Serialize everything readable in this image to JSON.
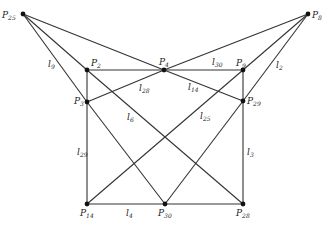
{
  "diagram": {
    "points": [
      {
        "id": "P25",
        "name": "P",
        "sub": "25",
        "x": 23,
        "y": 14,
        "lx": 2,
        "ly": 18
      },
      {
        "id": "P8",
        "name": "P",
        "sub": "8",
        "x": 308,
        "y": 14,
        "lx": 312,
        "ly": 18
      },
      {
        "id": "P2",
        "name": "P",
        "sub": "2",
        "x": 87,
        "y": 70,
        "lx": 91,
        "ly": 66
      },
      {
        "id": "P4",
        "name": "P",
        "sub": "4",
        "x": 164,
        "y": 70,
        "lx": 159,
        "ly": 65
      },
      {
        "id": "P9",
        "name": "P",
        "sub": "9",
        "x": 243,
        "y": 70,
        "lx": 236,
        "ly": 66
      },
      {
        "id": "P3",
        "name": "P",
        "sub": "3",
        "x": 87,
        "y": 102,
        "lx": 74,
        "ly": 104
      },
      {
        "id": "P29",
        "name": "P",
        "sub": "29",
        "x": 243,
        "y": 101,
        "lx": 247,
        "ly": 104
      },
      {
        "id": "P14",
        "name": "P",
        "sub": "14",
        "x": 87,
        "y": 204,
        "lx": 80,
        "ly": 216
      },
      {
        "id": "P30",
        "name": "P",
        "sub": "30",
        "x": 165,
        "y": 204,
        "lx": 158,
        "ly": 216
      },
      {
        "id": "P28",
        "name": "P",
        "sub": "28",
        "x": 243,
        "y": 204,
        "lx": 236,
        "ly": 216
      }
    ],
    "lines": [
      {
        "from": "P25",
        "to": "P4"
      },
      {
        "from": "P25",
        "to": "P2"
      },
      {
        "from": "P25",
        "to": "P3"
      },
      {
        "from": "P8",
        "to": "P4"
      },
      {
        "from": "P8",
        "to": "P9"
      },
      {
        "from": "P8",
        "to": "P29"
      },
      {
        "from": "P2",
        "to": "P9"
      },
      {
        "from": "P2",
        "to": "P14"
      },
      {
        "from": "P9",
        "to": "P28"
      },
      {
        "from": "P14",
        "to": "P28"
      },
      {
        "from": "P4",
        "to": "P3"
      },
      {
        "from": "P4",
        "to": "P29"
      },
      {
        "from": "P2",
        "to": "P28"
      },
      {
        "from": "P9",
        "to": "P14"
      },
      {
        "from": "P3",
        "to": "P30"
      },
      {
        "from": "P29",
        "to": "P30"
      }
    ],
    "line_labels": [
      {
        "name": "l",
        "sub": "9",
        "x": 48,
        "y": 67
      },
      {
        "name": "l",
        "sub": "28",
        "x": 139,
        "y": 91
      },
      {
        "name": "l",
        "sub": "14",
        "x": 188,
        "y": 90
      },
      {
        "name": "l",
        "sub": "30",
        "x": 212,
        "y": 65
      },
      {
        "name": "l",
        "sub": "2",
        "x": 276,
        "y": 68
      },
      {
        "name": "l",
        "sub": "6",
        "x": 127,
        "y": 120
      },
      {
        "name": "l",
        "sub": "25",
        "x": 200,
        "y": 119
      },
      {
        "name": "l",
        "sub": "29",
        "x": 77,
        "y": 155
      },
      {
        "name": "l",
        "sub": "3",
        "x": 247,
        "y": 155
      },
      {
        "name": "l",
        "sub": "4",
        "x": 126,
        "y": 216
      }
    ]
  }
}
